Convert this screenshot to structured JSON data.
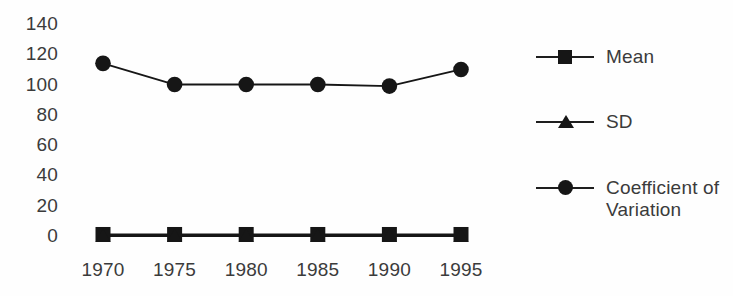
{
  "chart_data": {
    "type": "line",
    "title": "",
    "subtitle": "",
    "xlabel": "",
    "ylabel": "",
    "categories": [
      "1970",
      "1975",
      "1980",
      "1985",
      "1990",
      "1995"
    ],
    "x": [
      1970,
      1975,
      1980,
      1985,
      1990,
      1995
    ],
    "xlim": [
      1970,
      1995
    ],
    "ylim": [
      0,
      140
    ],
    "yticks": [
      "140",
      "120",
      "100",
      "80",
      "60",
      "40",
      "20",
      "0"
    ],
    "ytick_values": [
      140,
      120,
      100,
      80,
      60,
      40,
      20,
      0
    ],
    "grid": false,
    "legend_position": "right",
    "series": [
      {
        "name": "Mean",
        "marker": "square",
        "color": "#161616",
        "values": [
          1,
          1,
          1,
          1,
          1,
          1
        ]
      },
      {
        "name": "SD",
        "marker": "triangle",
        "color": "#161616",
        "values": [
          0,
          0,
          0,
          0,
          0,
          0
        ]
      },
      {
        "name": "Coefficient of Variation",
        "marker": "circle",
        "color": "#161616",
        "values": [
          114,
          100,
          100,
          100,
          99,
          110
        ]
      }
    ]
  },
  "legend": {
    "items": [
      {
        "label": "Mean",
        "marker": "square-marker-icon"
      },
      {
        "label": "SD",
        "marker": "triangle-marker-icon"
      },
      {
        "label": "Coefficient of\nVariation",
        "marker": "circle-marker-icon"
      }
    ]
  },
  "colors": {
    "ink": "#161616",
    "text": "#3b3b3b",
    "background": "#fefefe"
  }
}
